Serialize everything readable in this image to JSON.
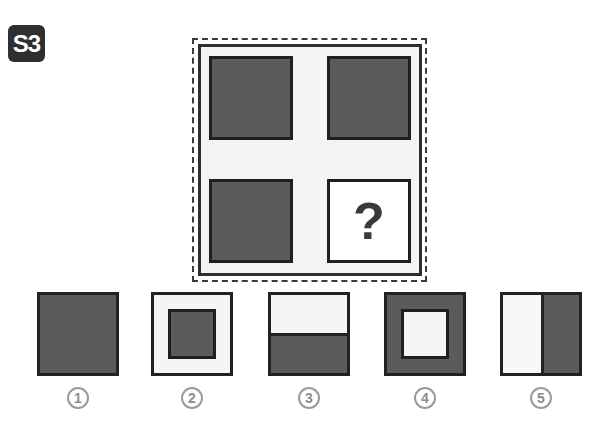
{
  "badge": {
    "label": "S3"
  },
  "puzzle": {
    "cells": [
      {
        "type": "dark-square"
      },
      {
        "type": "dark-square"
      },
      {
        "type": "dark-square"
      },
      {
        "type": "question",
        "label": "?"
      }
    ]
  },
  "options": [
    {
      "number": "1",
      "pattern": "solid-dark"
    },
    {
      "number": "2",
      "pattern": "light-with-dark-inner-square"
    },
    {
      "number": "3",
      "pattern": "light-top-dark-bottom"
    },
    {
      "number": "4",
      "pattern": "dark-with-light-inner-square"
    },
    {
      "number": "5",
      "pattern": "light-left-dark-right"
    }
  ],
  "colors": {
    "dark": "#5b5b5b",
    "light": "#f5f5f5",
    "border": "#222222",
    "number": "#8d8d8d"
  }
}
